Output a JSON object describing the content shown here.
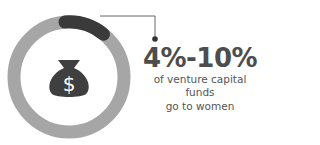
{
  "infographic": {
    "stat_value": "4%-10%",
    "caption_line1": "of venture capital funds",
    "caption_line2": "go to women",
    "icon": "money-bag-dollar-icon",
    "ring": {
      "highlight_fraction": 0.1,
      "track_color": "#a6a6a6",
      "highlight_color": "#3a3a3a"
    },
    "colors": {
      "text": "#4d4d4d",
      "icon": "#3f3f3f",
      "connector": "#555555"
    }
  }
}
